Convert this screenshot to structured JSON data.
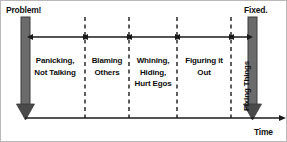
{
  "diagram": {
    "title_endpoints": {
      "start_label": "Problem!",
      "end_label": "Fixed.",
      "axis_label": "Time"
    },
    "colors": {
      "bar_fill": "#6b6b6b",
      "bar_stroke": "#3a3a3a",
      "arrowhead": "#1a1a1a",
      "line": "#1a1a1a",
      "divider": "#1a1a1a",
      "text": "#0d0d0d",
      "background": "#ffffff",
      "border": "#b9b9b9"
    },
    "phases": [
      {
        "id": "panicking",
        "label": "Panicking,\nNot Talking",
        "orientation": "horizontal",
        "start_x": 24,
        "end_x": 84
      },
      {
        "id": "blaming",
        "label": "Blaming\nOthers",
        "orientation": "horizontal",
        "start_x": 84,
        "end_x": 128
      },
      {
        "id": "whining",
        "label": "Whining,\nHiding,\nHurt Egos",
        "orientation": "horizontal",
        "start_x": 128,
        "end_x": 176
      },
      {
        "id": "figuring",
        "label": "Figuring it\nOut",
        "orientation": "horizontal",
        "start_x": 176,
        "end_x": 230
      },
      {
        "id": "fixing",
        "label": "Fixing Things",
        "orientation": "vertical",
        "start_x": 230,
        "end_x": 248
      }
    ],
    "dividers": [
      84,
      128,
      176,
      230
    ],
    "bars": [
      {
        "id": "problem-bar",
        "x": 24,
        "top": 16,
        "bottom": 117
      },
      {
        "id": "fixed-bar",
        "x": 251,
        "top": 16,
        "bottom": 117
      }
    ],
    "axis": {
      "y": 117,
      "start_x": 24,
      "end_x": 281
    },
    "arrow_row_y": 36
  }
}
